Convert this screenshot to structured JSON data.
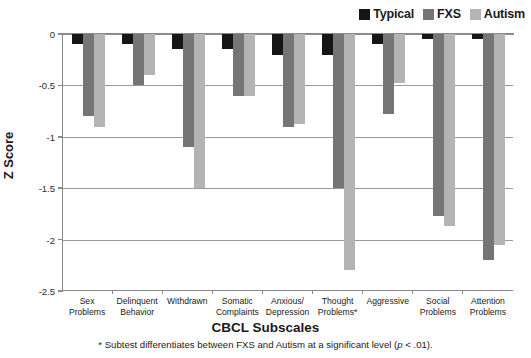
{
  "chart_data": {
    "type": "bar",
    "title": "",
    "xlabel": "CBCL Subscales",
    "ylabel": "Z Score",
    "ylim": [
      -2.5,
      0
    ],
    "yticks": [
      0,
      -0.5,
      -1,
      -1.5,
      -2,
      -2.5
    ],
    "ytick_labels": [
      "0",
      "-0.5",
      "-1",
      "-1.5",
      "-2",
      "-2.5"
    ],
    "grid": true,
    "legend_position": "top-right",
    "categories": [
      "Sex\nProblems",
      "Delinquent\nBehavior",
      "Withdrawn",
      "Somatic\nComplaints",
      "Anxious/\nDepression",
      "Thought\nProblems*",
      "Aggressive",
      "Social\nProblems",
      "Attention\nProblems"
    ],
    "series": [
      {
        "name": "Typical",
        "color": "#161616",
        "values": [
          -0.1,
          -0.1,
          -0.15,
          -0.15,
          -0.2,
          -0.2,
          -0.1,
          -0.05,
          -0.05
        ]
      },
      {
        "name": "FXS",
        "color": "#757575",
        "values": [
          -0.8,
          -0.5,
          -1.1,
          -0.6,
          -0.9,
          -1.5,
          -0.78,
          -1.77,
          -2.2
        ]
      },
      {
        "name": "Autism",
        "color": "#b4b4b4",
        "values": [
          -0.9,
          -0.4,
          -1.5,
          -0.6,
          -0.88,
          -2.3,
          -0.48,
          -1.87,
          -2.05
        ]
      }
    ],
    "annotation": "* Subtest differentiates between FXS and Autism at a significant level (p < .01)."
  },
  "legend": {
    "items": [
      {
        "label": "Typical",
        "color": "#161616"
      },
      {
        "label": "FXS",
        "color": "#757575"
      },
      {
        "label": "Autism",
        "color": "#b4b4b4"
      }
    ]
  },
  "footnote": {
    "marker": "*",
    "text_before": " Subtest differentiates between FXS and Autism at a significant level (",
    "italic": "p",
    "text_after": " < .01)."
  }
}
